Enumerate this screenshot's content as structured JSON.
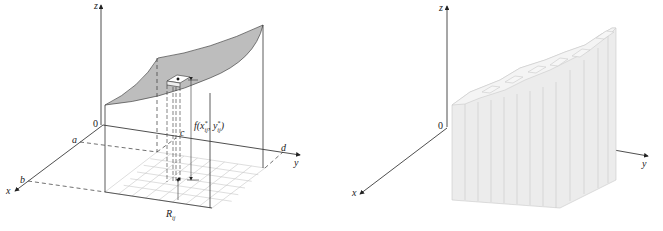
{
  "figure": {
    "left_panel": {
      "title": "Surface z = f(x, y) over rectangle R with sample column",
      "axes": {
        "z_label": "z",
        "x_label": "x",
        "y_label": "y",
        "origin_label": "0"
      },
      "bounds": {
        "a": "a",
        "b": "b",
        "c": "c",
        "d": "d"
      },
      "height_label": "f(x",
      "height_label_sub1": "ij",
      "height_label_sup1": "*",
      "height_label_mid": ", y",
      "height_label_sub2": "ij",
      "height_label_sup2": "*",
      "height_label_end": ")",
      "region_label": "R",
      "region_label_sub": "ij",
      "grid": {
        "rows": 6,
        "cols": 8
      },
      "colors": {
        "surface": "#bdbdbd",
        "grid": "#c8c8c8",
        "lines": "#333333"
      }
    },
    "right_panel": {
      "title": "Approximating rectangular boxes",
      "axes": {
        "z_label": "z",
        "x_label": "x",
        "y_label": "y",
        "origin_label": "0"
      },
      "box_columns": 12,
      "colors": {
        "box_face": "#ececec",
        "box_top": "#f4f4f4",
        "box_edge": "#c9c9c9"
      }
    }
  }
}
